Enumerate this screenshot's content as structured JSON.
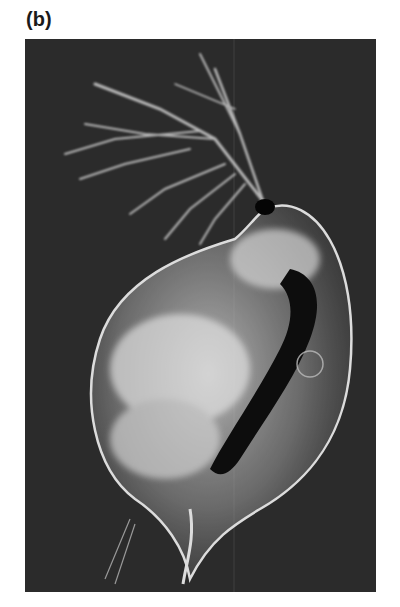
{
  "figure": {
    "panel_label": "(b)",
    "background_color": "#2b2b2b"
  }
}
